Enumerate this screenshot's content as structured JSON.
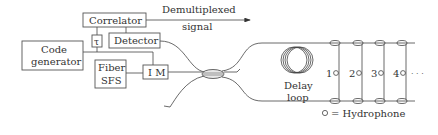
{
  "diagram": {
    "type": "block-diagram",
    "blocks": {
      "correlator": "Correlator",
      "tau": "τ",
      "detector": "Detector",
      "code_generator_line1": "Code",
      "code_generator_line2": "generator",
      "fiber_sfs_line1": "Fiber",
      "fiber_sfs_line2": "SFS",
      "im": "I M"
    },
    "output": {
      "line1": "Demultiplexed",
      "line2": "signal"
    },
    "delay_loop": {
      "line1": "Delay",
      "line2": "loop"
    },
    "hydrophones": [
      {
        "label": "1"
      },
      {
        "label": "2"
      },
      {
        "label": "3"
      },
      {
        "label": "4"
      }
    ],
    "ellipsis": "· · ·",
    "legend": {
      "symbol": "○",
      "text": "= Hydrophone"
    },
    "colors": {
      "stroke": "#444444",
      "text": "#333333",
      "background": "#ffffff"
    }
  }
}
